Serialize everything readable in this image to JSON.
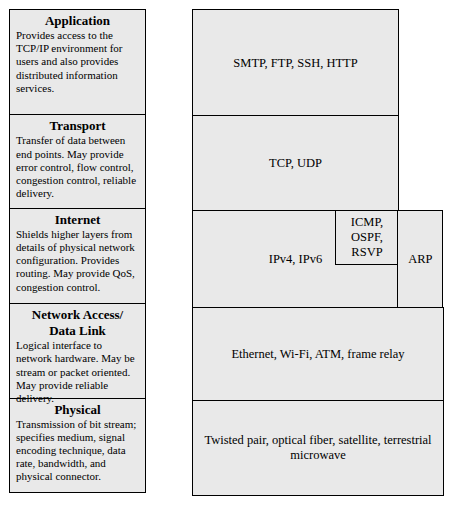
{
  "diagram": {
    "fill_color": "#e9e9e9",
    "border_color": "#000000",
    "layers": [
      {
        "name": "Application",
        "description": "Provides access to the TCP/IP environment for users and also provides distributed information services.",
        "protocols": "SMTP, FTP, SSH, HTTP"
      },
      {
        "name": "Transport",
        "description": "Transfer of data between end points. May provide error control, flow control, congestion control, reliable delivery.",
        "protocols": "TCP, UDP"
      },
      {
        "name": "Internet",
        "description": "Shields higher layers from details of physical network configuration. Provides routing. May provide QoS, congestion control.",
        "protocols": "IPv4, IPv6",
        "sub_protocols": {
          "control": [
            "ICMP,",
            "OSPF,",
            "RSVP"
          ],
          "address_resolution": "ARP"
        }
      },
      {
        "name_line1": "Network Access/",
        "name_line2": "Data Link",
        "description": "Logical interface to network hardware. May be stream or packet oriented. May provide reliable delivery.",
        "protocols": "Ethernet, Wi-Fi, ATM, frame relay"
      },
      {
        "name": "Physical",
        "description": "Transmission of bit stream; specifies medium, signal encoding technique, data rate, bandwidth, and physical connector.",
        "protocols": "Twisted pair, optical fiber, satellite, terrestrial microwave"
      }
    ]
  }
}
